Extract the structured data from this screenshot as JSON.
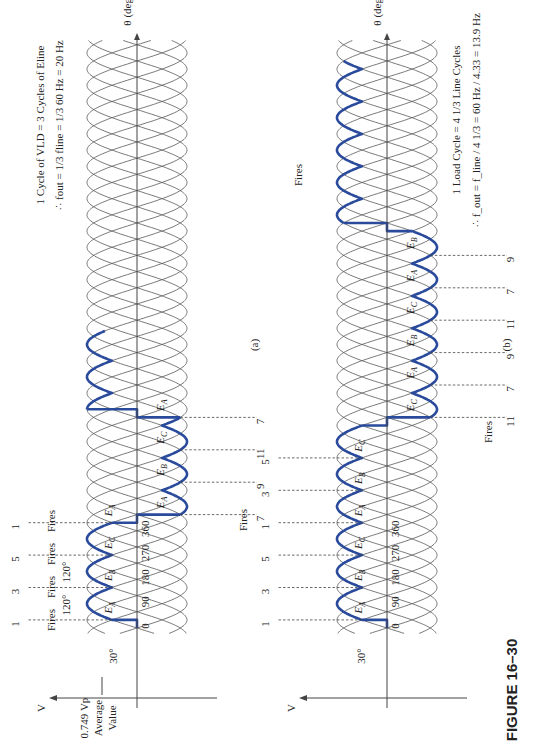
{
  "figure": {
    "caption": "FIGURE 16–30",
    "rotation_deg": -90
  },
  "colors": {
    "output_wave": "#2a4a9c",
    "phase_lines": "#555555",
    "text": "#222222"
  },
  "axes": {
    "vertical_label": "V",
    "vertical_sub": "LD",
    "horizontal_label": "θ (deg)",
    "ticks": [
      "0",
      "90",
      "180",
      "270",
      "360"
    ]
  },
  "panel_a": {
    "label": "(a)",
    "average_value": {
      "line1": "0.749 V",
      "line1_sub": "p",
      "line2": "Average",
      "line3": "Value"
    },
    "delay_angle": "30°",
    "interval_label": "120°",
    "fires_word": "Fires",
    "top_firings": [
      "1",
      "3",
      "5",
      "1",
      "3",
      "5",
      "1"
    ],
    "bottom_firings": [
      "7",
      "9",
      "11",
      "7",
      "9",
      "11"
    ],
    "bumps_top_1": [
      "E_A",
      "E_B",
      "E_C",
      "E_A"
    ],
    "bumps_bottom": [
      "E_A",
      "E_B",
      "E_C",
      "E_A"
    ],
    "bumps_top_2": [
      "E_A",
      "E_B",
      "E_C",
      "E_A"
    ],
    "bumps_bottom_2": [
      "E_A",
      "E_B",
      "E_C"
    ],
    "info_line1": "1 Cycle of V_LD = 3 Cycles of E_line",
    "info_line2": "∴ f_out = 1/3 f_line = 1/3 60 Hz = 20 Hz"
  },
  "panel_b": {
    "label": "(b)",
    "delay_angle": "30°",
    "fires_word": "Fires",
    "top_firings": [
      "1",
      "3",
      "5",
      "1",
      "3",
      "5"
    ],
    "bottom_firings": [
      "11",
      "7",
      "9",
      "11",
      "7",
      "9"
    ],
    "top_firings_2": [
      "3",
      "5",
      "1",
      "3"
    ],
    "bumps_top_1": [
      "E_A",
      "E_B",
      "E_C",
      "E_A",
      "E_B",
      "E_C"
    ],
    "bumps_bottom": [
      "E_C",
      "E_A",
      "E_B",
      "E_C",
      "E_A",
      "E_B"
    ],
    "bumps_top_2": [
      "E_B",
      "E_C",
      "E_A"
    ],
    "info_line1": "1 Load Cycle = 4 1/3 Line Cycles",
    "info_line2": "∴ f_out = f_line / 4 1/3 = 60 Hz / 4.33 = 13.9 Hz"
  }
}
